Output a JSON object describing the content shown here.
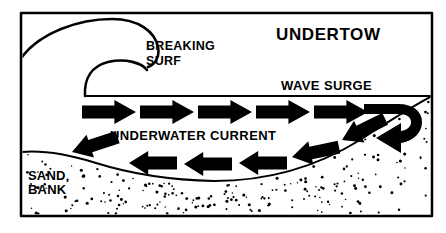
{
  "figure": {
    "title": "UNDERTOW",
    "type": "diagram",
    "palette": {
      "ink": "#000000",
      "paper": "#ffffff"
    },
    "frame": {
      "x": 21,
      "y": 13,
      "width": 411,
      "height": 203,
      "stroke_width": 2.5
    }
  },
  "labels": {
    "title": "UNDERTOW",
    "breaking_surf_line1": "BREAKING",
    "breaking_surf_line2": "SURF",
    "wave_surge": "WAVE SURGE",
    "underwater_current": "UNDERWATER CURRENT",
    "sand_line1": "SAND",
    "sand_line2": "BANK"
  },
  "label_positions": {
    "title": {
      "x": 276,
      "y": 40
    },
    "breaking_surf_line1": {
      "x": 146,
      "y": 50
    },
    "breaking_surf_line2": {
      "x": 146,
      "y": 65
    },
    "wave_surge": {
      "x": 281,
      "y": 90
    },
    "underwater_current": {
      "x": 110,
      "y": 140
    },
    "sand_line1": {
      "x": 28,
      "y": 180
    },
    "sand_line2": {
      "x": 28,
      "y": 194
    }
  },
  "waterline": {
    "description": "horizontal sea surface from breaking wave base to right frame edge",
    "y": 96,
    "x_start": 85,
    "x_end": 432
  },
  "wave": {
    "description": "breaking wave crest curling over with inner tube curl",
    "outer_curl": "M22,57 C40,33 78,19 112,19 C139,19 155,32 158,47 C160,57 155,65 148,67",
    "inner_curl": "M85,96 C84,78 92,66 108,62 C126,58 142,63 147,70",
    "hook_tip": {
      "x": 148,
      "y": 67
    }
  },
  "sandbank": {
    "description": "stippled sea floor rising at left edge, dipping in the middle, climbing steeply to the right",
    "profile": "M22,152 C46,150 70,155 96,163 C128,173 168,180 214,181 C268,181 318,166 360,140 C388,122 412,106 432,96",
    "dot_count": 210,
    "dot_radius_range": [
      0.7,
      1.6
    ]
  },
  "surge_arrows": {
    "direction": "right",
    "count": 5,
    "note": "shoreward wave surge just below the sea surface",
    "items": [
      {
        "x": 82,
        "y": 112,
        "length": 54,
        "thickness": 13,
        "angle": 0
      },
      {
        "x": 140,
        "y": 112,
        "length": 54,
        "thickness": 13,
        "angle": 0
      },
      {
        "x": 198,
        "y": 112,
        "length": 54,
        "thickness": 13,
        "angle": 0
      },
      {
        "x": 256,
        "y": 112,
        "length": 54,
        "thickness": 13,
        "angle": 0
      },
      {
        "x": 314,
        "y": 112,
        "length": 54,
        "thickness": 13,
        "angle": 0
      }
    ]
  },
  "turn_arrow": {
    "description": "thick U-turn hook where the surge reverses into the undertow",
    "note": "curves right, down, and back to the left ending in an arrowhead"
  },
  "return_arrows": {
    "direction": "left",
    "count": 6,
    "note": "undertow flowing seaward along the sand bank slope",
    "items": [
      {
        "x": 72,
        "y": 152,
        "length": 48,
        "thickness": 13,
        "angle": -18
      },
      {
        "x": 129,
        "y": 163,
        "length": 48,
        "thickness": 13,
        "angle": 0
      },
      {
        "x": 184,
        "y": 164,
        "length": 48,
        "thickness": 13,
        "angle": 0
      },
      {
        "x": 239,
        "y": 163,
        "length": 48,
        "thickness": 13,
        "angle": 0
      },
      {
        "x": 292,
        "y": 157,
        "length": 48,
        "thickness": 13,
        "angle": -12
      },
      {
        "x": 342,
        "y": 140,
        "length": 48,
        "thickness": 13,
        "angle": -26
      }
    ]
  }
}
